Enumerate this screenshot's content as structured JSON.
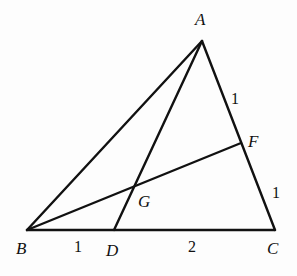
{
  "diagram": {
    "type": "triangle-geometry",
    "points": {
      "A": {
        "label": "A",
        "x": 202,
        "y": 41
      },
      "B": {
        "label": "B",
        "x": 27,
        "y": 230
      },
      "C": {
        "label": "C",
        "x": 275,
        "y": 230
      },
      "D": {
        "label": "D",
        "x": 114,
        "y": 230
      },
      "F": {
        "label": "F",
        "x": 241,
        "y": 143
      },
      "G": {
        "label": "G",
        "x": 133,
        "y": 187
      }
    },
    "segments": [
      {
        "name": "AB",
        "from": "A",
        "to": "B"
      },
      {
        "name": "AC",
        "from": "A",
        "to": "C"
      },
      {
        "name": "BC",
        "from": "B",
        "to": "C"
      },
      {
        "name": "AD",
        "from": "A",
        "to": "D"
      },
      {
        "name": "BF",
        "from": "B",
        "to": "F"
      }
    ],
    "lengths": {
      "AF": "1",
      "FC": "1",
      "BD": "1",
      "DC": "2"
    }
  }
}
